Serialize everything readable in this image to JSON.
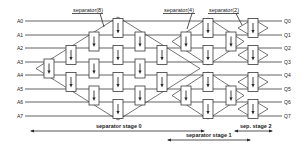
{
  "diagram": {
    "inputs": [
      "A0",
      "A1",
      "A2",
      "A3",
      "A4",
      "A5",
      "A6",
      "A7"
    ],
    "outputs": [
      "Q0",
      "Q1",
      "Q2",
      "Q3",
      "Q4",
      "Q5",
      "Q6",
      "Q7"
    ],
    "separator_labels": {
      "sep8": "separator(8)",
      "sep4": "separator(4)",
      "sep2": "separator(2)"
    },
    "stage_labels": {
      "stage0": "separator stage 0",
      "stage1": "separator stage 1",
      "stage2": "sep. stage 2"
    },
    "box_icon": "down-arrow-icon",
    "colors": {
      "line": "#3a3a3a",
      "background": "#ffffff"
    }
  }
}
